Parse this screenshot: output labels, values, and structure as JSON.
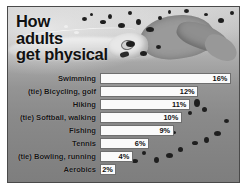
{
  "infographic": {
    "title": "How\nadults\nget physical",
    "background_description": "grayscale photo of a swimmer with splashing water",
    "panel_color": "#8c8c8c",
    "bar_color": "#fafafa",
    "text_color": "#111111"
  },
  "chart_data": {
    "type": "bar",
    "orientation": "horizontal",
    "title": "How adults get physical",
    "xlabel": "",
    "ylabel": "",
    "xlim": [
      0,
      17
    ],
    "grid": false,
    "legend": false,
    "value_suffix": "%",
    "categories": [
      "Swimming",
      "(tie) Bicycling, golf",
      "Hiking",
      "(tie) Softball, walking",
      "Fishing",
      "Tennis",
      "(tie) Bowling, running",
      "Aerobics"
    ],
    "values": [
      16,
      12,
      11,
      10,
      9,
      6,
      4,
      2
    ],
    "value_labels": [
      "16%",
      "12%",
      "11%",
      "10%",
      "9%",
      "6%",
      "4%",
      "2%"
    ]
  }
}
